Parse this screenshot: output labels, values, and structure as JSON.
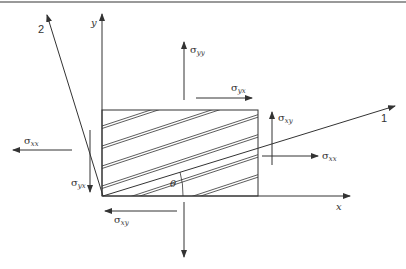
{
  "figure": {
    "type": "stress-element-diagram",
    "axes": {
      "x_label": "x",
      "y_label": "y",
      "axis1_label": "1",
      "axis2_label": "2",
      "angle_label": "θ"
    },
    "stresses": {
      "sigma_yy": {
        "symbol": "σ",
        "sub": "yy"
      },
      "sigma_yx_top": {
        "symbol": "σ",
        "sub": "yx"
      },
      "sigma_xy_right": {
        "symbol": "σ",
        "sub": "xy"
      },
      "sigma_xx_right": {
        "symbol": "σ",
        "sub": "xx"
      },
      "sigma_xx_left": {
        "symbol": "σ",
        "sub": "xx"
      },
      "sigma_yx_left": {
        "symbol": "σ",
        "sub": "yx"
      },
      "sigma_xy_bottom": {
        "symbol": "σ",
        "sub": "xy"
      }
    },
    "colors": {
      "line": "#333333",
      "top_rule": "#777777"
    }
  }
}
